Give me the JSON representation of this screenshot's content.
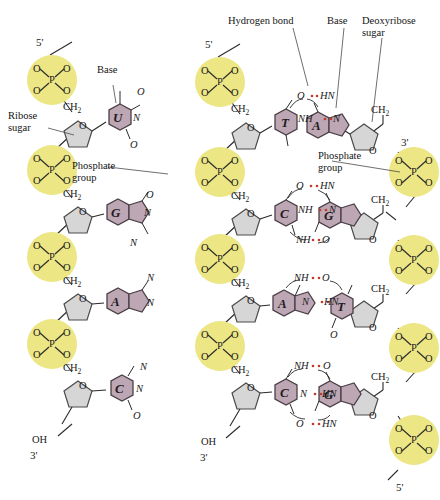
{
  "figure": {
    "background": "#ffffff",
    "colors": {
      "phosphate_fill": "#ece684",
      "phosphate_stroke": "#b5a93a",
      "sugar_fill": "#d6d6d6",
      "sugar_stroke": "#4a4a4a",
      "base_fill": "#bda7b4",
      "base_stroke": "#4a3f46",
      "bond_line": "#2b2b2b",
      "hbond_dot": "#c0392b",
      "leader_line": "#4a4a4a",
      "text": "#141414"
    }
  },
  "callouts": {
    "rna": [
      {
        "id": "base",
        "text": "Base"
      },
      {
        "id": "ribose_sugar",
        "text": "Ribose\nsugar"
      },
      {
        "id": "phosphate_group",
        "text": "Phosphate\ngroup"
      }
    ],
    "dna": [
      {
        "id": "hydrogen_bond",
        "text": "Hydrogen bond"
      },
      {
        "id": "base",
        "text": "Base"
      },
      {
        "id": "deoxyribose_sugar",
        "text": "Deoxyribose\nsugar"
      },
      {
        "id": "phosphate_group",
        "text": "Phosphate\ngroup"
      }
    ]
  },
  "rna_strand": {
    "name": "RNA",
    "sugar_type": "Ribose",
    "end_top": "5'",
    "end_bottom": "3'",
    "terminal_hydroxyl": "OH",
    "phosphate_symbol": "P",
    "phosphate_oxygens": [
      "O",
      "O",
      "O",
      "O"
    ],
    "methylene_label": "CH",
    "methylene_sub": "2",
    "ring_oxygen": "O",
    "nucleotides": [
      {
        "base": "U",
        "base_name": "uracil",
        "type": "pyrimidine",
        "substituents": [
          "O",
          "N",
          "O"
        ]
      },
      {
        "base": "G",
        "base_name": "guanine",
        "type": "purine",
        "substituents": [
          "O",
          "N",
          "N"
        ]
      },
      {
        "base": "A",
        "base_name": "adenine",
        "type": "purine",
        "substituents": [
          "N",
          "N"
        ]
      },
      {
        "base": "C",
        "base_name": "cytosine",
        "type": "pyrimidine",
        "substituents": [
          "N",
          "N",
          "O"
        ]
      }
    ]
  },
  "dna_duplex": {
    "name": "DNA",
    "sugar_type": "Deoxyribose",
    "left_strand": {
      "end_top": "5'",
      "end_bottom": "3'",
      "terminal_hydroxyl": "OH"
    },
    "right_strand": {
      "end_top": "3'",
      "end_bottom": "5'"
    },
    "phosphate_symbol": "P",
    "methylene_label": "CH",
    "methylene_sub": "2",
    "ring_oxygen": "O",
    "base_pairs": [
      {
        "left_base": "T",
        "right_base": "A",
        "left_name": "thymine",
        "right_name": "adenine",
        "hbond_count": 2,
        "hbonds": [
          {
            "left_atom": "O",
            "right_atom": "HN",
            "dots": 2
          },
          {
            "left_atom": "NH",
            "right_atom": "N",
            "dots": 2
          }
        ]
      },
      {
        "left_base": "C",
        "right_base": "G",
        "left_name": "cytosine",
        "right_name": "guanine",
        "hbond_count": 3,
        "hbonds": [
          {
            "left_atom": "O",
            "right_atom": "HN",
            "dots": 2
          },
          {
            "left_atom": "NH",
            "right_atom": "N",
            "dots": 2
          },
          {
            "left_atom": "NH",
            "right_atom": "O",
            "dots": 2
          }
        ]
      },
      {
        "left_base": "A",
        "right_base": "T",
        "left_name": "adenine",
        "right_name": "thymine",
        "hbond_count": 2,
        "hbonds": [
          {
            "left_atom": "NH",
            "right_atom": "O",
            "dots": 2
          },
          {
            "left_atom": "N",
            "right_atom": "HN",
            "dots": 2
          }
        ],
        "extra_atoms": [
          "O"
        ]
      },
      {
        "left_base": "C",
        "right_base": "G",
        "left_name": "cytosine",
        "right_name": "guanine",
        "hbond_count": 3,
        "hbonds": [
          {
            "left_atom": "NH",
            "right_atom": "O",
            "dots": 2
          },
          {
            "left_atom": "N",
            "right_atom": "HN",
            "dots": 2
          },
          {
            "left_atom": "O",
            "right_atom": "HN",
            "dots": 2
          }
        ]
      }
    ]
  }
}
